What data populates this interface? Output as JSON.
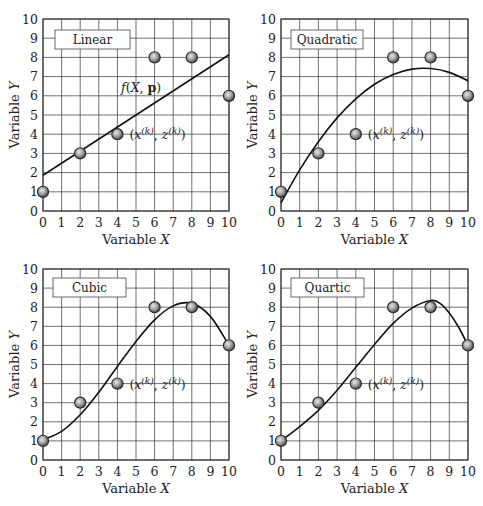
{
  "chart_data": [
    {
      "type": "scatter",
      "title": "Linear",
      "xlabel": "Variable X",
      "ylabel": "Variable Y",
      "xlim": [
        0,
        10
      ],
      "ylim": [
        0,
        10
      ],
      "grid": true,
      "xticks": [
        0,
        1,
        2,
        3,
        4,
        5,
        6,
        7,
        8,
        9,
        10
      ],
      "yticks": [
        0,
        1,
        2,
        3,
        4,
        5,
        6,
        7,
        8,
        9,
        10
      ],
      "points": {
        "x": [
          0,
          2,
          4,
          6,
          8,
          10
        ],
        "y": [
          1,
          3,
          4,
          8,
          8,
          6
        ]
      },
      "fit_curve": {
        "name": "f(X, p)",
        "x": [
          0,
          10
        ],
        "y": [
          1.86,
          8.14
        ]
      },
      "annotations": [
        "f(X,p)",
        "(x(k), z(k))"
      ]
    },
    {
      "type": "scatter",
      "title": "Quadratic",
      "xlabel": "Variable X",
      "ylabel": "Variable Y",
      "xlim": [
        0,
        10
      ],
      "ylim": [
        0,
        10
      ],
      "grid": true,
      "xticks": [
        0,
        1,
        2,
        3,
        4,
        5,
        6,
        7,
        8,
        9,
        10
      ],
      "yticks": [
        0,
        1,
        2,
        3,
        4,
        5,
        6,
        7,
        8,
        9,
        10
      ],
      "points": {
        "x": [
          0,
          2,
          4,
          6,
          8,
          10
        ],
        "y": [
          1,
          3,
          4,
          8,
          8,
          6
        ]
      },
      "fit_curve": {
        "x": [
          0,
          1,
          2,
          3,
          4,
          5,
          6,
          7,
          8,
          9,
          10
        ],
        "y": [
          0.43,
          2.14,
          3.61,
          4.85,
          5.84,
          6.6,
          7.11,
          7.39,
          7.42,
          7.22,
          6.78
        ]
      },
      "annotations": [
        "(x(k), z(k))"
      ]
    },
    {
      "type": "scatter",
      "title": "Cubic",
      "xlabel": "Variable X",
      "ylabel": "Variable Y",
      "xlim": [
        0,
        10
      ],
      "ylim": [
        0,
        10
      ],
      "grid": true,
      "xticks": [
        0,
        1,
        2,
        3,
        4,
        5,
        6,
        7,
        8,
        9,
        10
      ],
      "yticks": [
        0,
        1,
        2,
        3,
        4,
        5,
        6,
        7,
        8,
        9,
        10
      ],
      "points": {
        "x": [
          0,
          2,
          4,
          6,
          8,
          10
        ],
        "y": [
          1,
          3,
          4,
          8,
          8,
          6
        ]
      },
      "fit_curve": {
        "x": [
          0,
          1,
          2,
          3,
          4,
          5,
          6,
          7,
          8,
          9,
          10
        ],
        "y": [
          1.06,
          1.5,
          2.37,
          3.55,
          4.9,
          6.21,
          7.34,
          8.07,
          8.2,
          7.52,
          6.0
        ]
      },
      "annotations": [
        "(x(k), z(k))"
      ]
    },
    {
      "type": "scatter",
      "title": "Quartic",
      "xlabel": "Variable X",
      "ylabel": "Variable Y",
      "xlim": [
        0,
        10
      ],
      "ylim": [
        0,
        10
      ],
      "grid": true,
      "xticks": [
        0,
        1,
        2,
        3,
        4,
        5,
        6,
        7,
        8,
        9,
        10
      ],
      "yticks": [
        0,
        1,
        2,
        3,
        4,
        5,
        6,
        7,
        8,
        9,
        10
      ],
      "points": {
        "x": [
          0,
          2,
          4,
          6,
          8,
          10
        ],
        "y": [
          1,
          3,
          4,
          8,
          8,
          6
        ]
      },
      "fit_curve": {
        "x": [
          0,
          1,
          2,
          3,
          4,
          5,
          6,
          7,
          8,
          8.5,
          9,
          9.5,
          10
        ],
        "y": [
          1.0,
          1.75,
          2.6,
          3.65,
          4.85,
          6.05,
          7.15,
          7.95,
          8.35,
          8.2,
          7.7,
          6.95,
          6.0
        ]
      },
      "annotations": [
        "(x(k), z(k))"
      ]
    }
  ]
}
